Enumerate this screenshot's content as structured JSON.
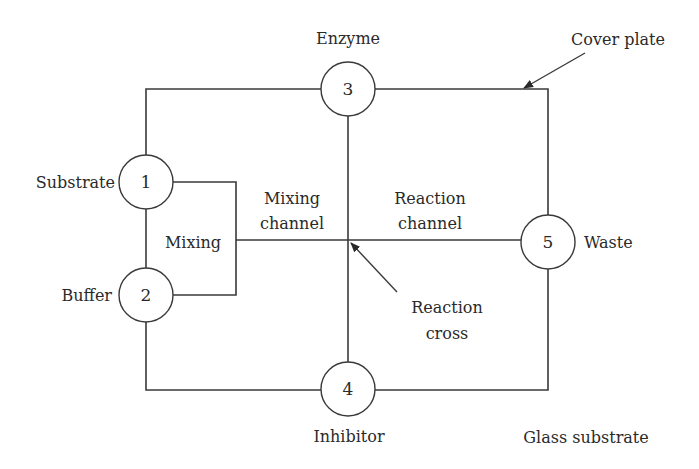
{
  "diagram": {
    "ports": [
      {
        "id": "1",
        "label": "Substrate"
      },
      {
        "id": "2",
        "label": "Buffer"
      },
      {
        "id": "3",
        "label": "Enzyme"
      },
      {
        "id": "4",
        "label": "Inhibitor"
      },
      {
        "id": "5",
        "label": "Waste"
      }
    ],
    "labels": {
      "mixing": "Mixing",
      "mixing_channel_1": "Mixing",
      "mixing_channel_2": "channel",
      "reaction_channel_1": "Reaction",
      "reaction_channel_2": "channel",
      "reaction_cross_1": "Reaction",
      "reaction_cross_2": "cross",
      "cover_plate": "Cover plate",
      "glass_substrate": "Glass substrate"
    }
  }
}
